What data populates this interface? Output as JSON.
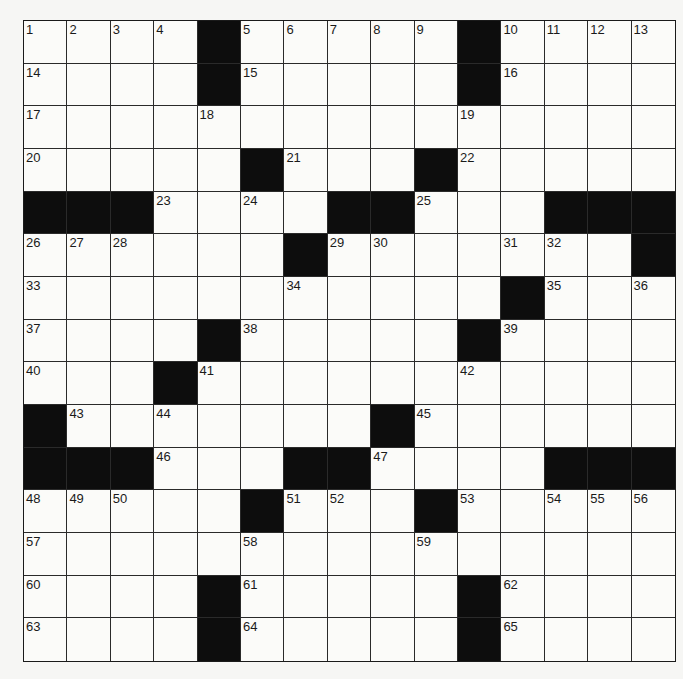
{
  "puzzle": {
    "rows": 15,
    "cols": 15,
    "colors": {
      "block": "#0d0d0d",
      "cell": "#fbfbf9",
      "line": "#2a2a2a",
      "background": "#f6f6f4"
    },
    "grid": [
      ".....#.....#....",
      "x"
    ],
    "layout": [
      "1,2,3,4,#,5,6,7,8,9,#,10,11,12,13",
      "14,_,_,_,#,15,_,_,_,_,#,16,_,_,_",
      "17,_,_,_,18,_,_,_,_,_,19,_,_,_,_",
      "20,_,_,_,_,#,21,_,_,#,22,_,_,_,_",
      "#,#,#,23,_,24,_,#,#,25,_,_,#,#,#",
      "26,27,28,_,_,_,#,29,30,_,_,31,32,_,#",
      "33,_,_,_,_,_,34,_,_,_,_,#,35,_,36",
      "37,_,_,_,#,38,_,_,_,_,#,39,_,_,_",
      "40,_,_,#,41,_,_,_,_,_,42,_,_,_,_",
      "#,43,_,44,_,_,_,_,#,45,_,_,_,_,_",
      "#,#,#,46,_,_,#,#,47,_,_,_,#,#,#",
      "48,49,50,_,_,#,51,52,_,#,53,_,54,55,56",
      "57,_,_,_,_,58,_,_,_,59,_,_,_,_,_",
      "60,_,_,_,#,61,_,_,_,_,#,62,_,_,_",
      "63,_,_,_,#,64,_,_,_,_,#,65,_,_,_"
    ],
    "entries": {}
  }
}
